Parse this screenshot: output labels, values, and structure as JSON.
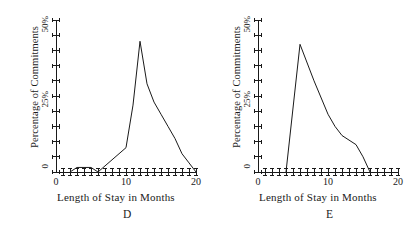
{
  "figure": {
    "panels": [
      {
        "letter": "D",
        "xlabel": "Length of Stay in Months",
        "ylabel": "Percentage of Commitments",
        "ytick_labels": [
          "50%",
          "25%",
          "0"
        ],
        "xtick_labels": [
          "0",
          "10",
          "20"
        ]
      },
      {
        "letter": "E",
        "xlabel": "Length of Stay in Months",
        "ylabel": "Percentage of Commitments",
        "ytick_labels": [
          "50%",
          "25%",
          "0"
        ],
        "xtick_labels": [
          "0",
          "10",
          "20"
        ]
      }
    ]
  },
  "chart_data": [
    {
      "type": "line",
      "title": "D",
      "xlabel": "Length of Stay in Months",
      "ylabel": "Percentage of Commitments",
      "xlim": [
        0,
        20
      ],
      "ylim": [
        0,
        50
      ],
      "xticks": [
        0,
        1,
        2,
        3,
        4,
        5,
        6,
        7,
        8,
        9,
        10,
        11,
        12,
        13,
        14,
        15,
        16,
        17,
        18,
        19,
        20
      ],
      "xtick_labels_shown": {
        "0": "0",
        "10": "10",
        "20": "20"
      },
      "yticks": [
        0,
        5,
        10,
        15,
        20,
        25,
        30,
        35,
        40,
        45,
        50
      ],
      "ytick_labels_shown": {
        "0": "0",
        "25": "25%",
        "50": "50%"
      },
      "grid": false,
      "legend": "none",
      "x": [
        2,
        3,
        4,
        5,
        6,
        7,
        8,
        9,
        10,
        11,
        12,
        13,
        14,
        15,
        16,
        17,
        18,
        19,
        20
      ],
      "values": [
        0,
        1.5,
        1.5,
        1.5,
        0,
        2,
        4,
        6,
        8,
        22,
        43,
        29,
        23,
        19,
        15,
        11,
        6,
        3,
        0
      ]
    },
    {
      "type": "line",
      "title": "E",
      "xlabel": "Length of Stay in Months",
      "ylabel": "Percentage of Commitments",
      "xlim": [
        0,
        20
      ],
      "ylim": [
        0,
        50
      ],
      "xticks": [
        0,
        1,
        2,
        3,
        4,
        5,
        6,
        7,
        8,
        9,
        10,
        11,
        12,
        13,
        14,
        15,
        16,
        17,
        18,
        19,
        20
      ],
      "xtick_labels_shown": {
        "0": "0",
        "10": "10",
        "20": "20"
      },
      "yticks": [
        0,
        5,
        10,
        15,
        20,
        25,
        30,
        35,
        40,
        45,
        50
      ],
      "ytick_labels_shown": {
        "0": "0",
        "25": "25%",
        "50": "50%"
      },
      "grid": false,
      "legend": "none",
      "x": [
        4,
        6,
        8,
        10,
        11,
        12,
        13,
        14,
        15,
        16
      ],
      "values": [
        0,
        42,
        30,
        19,
        15,
        12,
        10.5,
        9,
        5,
        0
      ]
    }
  ],
  "style": {
    "ink": "#1a1a1a",
    "background": "#ffffff"
  }
}
